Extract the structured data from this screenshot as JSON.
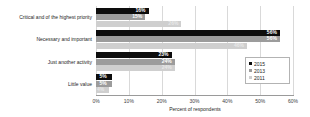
{
  "chart_data": {
    "type": "bar",
    "orientation": "horizontal",
    "title": "",
    "subtitle": "",
    "xlabel": "Percent of respondents",
    "ylabel": "",
    "xlim": [
      0,
      60
    ],
    "xticks": [
      0,
      10,
      20,
      30,
      40,
      50,
      60
    ],
    "xtick_labels": [
      "0%",
      "10%",
      "20%",
      "30%",
      "40%",
      "50%",
      "60%"
    ],
    "grid": true,
    "legend_position": "center-right",
    "categories": [
      "Critical and of the highest priority",
      "Necessary and important",
      "Just another activity",
      "Little value"
    ],
    "series": [
      {
        "name": "2015",
        "color": "#0d0d0d",
        "values": [
          16,
          56,
          23,
          5
        ],
        "labels": [
          "16%",
          "56%",
          "23%",
          "5%"
        ]
      },
      {
        "name": "2013",
        "color": "#9c9c9c",
        "values": [
          15,
          56,
          24,
          5
        ],
        "labels": [
          "15%",
          "56%",
          "24%",
          "5%"
        ]
      },
      {
        "name": "2011",
        "color": "#cfcfcf",
        "values": [
          26,
          46,
          24,
          4
        ],
        "labels": [
          "26%",
          "46%",
          "24%",
          "4%"
        ]
      }
    ]
  }
}
